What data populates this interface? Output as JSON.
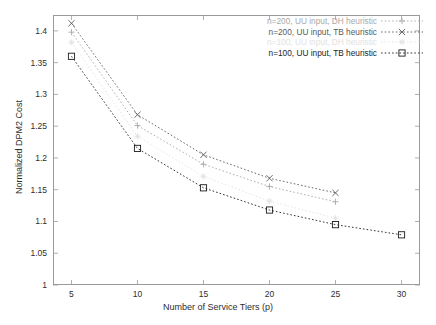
{
  "chart_data": {
    "type": "line",
    "title": "",
    "xlabel": "Number of Service Tiers (p)",
    "ylabel": "Normalized DPM2 Cost",
    "xlim": [
      3.6,
      31.4
    ],
    "ylim": [
      1,
      1.425
    ],
    "xticks": [
      5,
      10,
      15,
      20,
      25,
      30
    ],
    "xtick_labels": [
      "5",
      "10",
      "15",
      "20",
      "25",
      "30"
    ],
    "yticks": [
      1,
      1.05,
      1.1,
      1.15,
      1.2,
      1.25,
      1.3,
      1.35,
      1.4
    ],
    "ytick_labels": [
      "1",
      "1.05",
      "1.1",
      "1.15",
      "1.2",
      "1.25",
      "1.3",
      "1.35",
      "1.4"
    ],
    "grid": false,
    "legend_position": "top-right",
    "series": [
      {
        "name": "n=200, UU input, DH heuristic",
        "marker": "plus",
        "color": "#a9a9a9",
        "linestyle": "dotted",
        "x": [
          5,
          10,
          15,
          20,
          25
        ],
        "values": [
          1.398,
          1.251,
          1.19,
          1.155,
          1.131
        ]
      },
      {
        "name": "n=200, UU input, TB heuristic",
        "marker": "cross",
        "color": "#5a5a5a",
        "linestyle": "dotted",
        "x": [
          5,
          10,
          15,
          20,
          25
        ],
        "values": [
          1.412,
          1.268,
          1.205,
          1.168,
          1.145
        ]
      },
      {
        "name": "n=100, UU input, DH heuristic",
        "marker": "star",
        "color": "#e2e2e2",
        "linestyle": "dotted",
        "x": [
          5,
          10,
          15,
          20,
          25
        ],
        "values": [
          1.382,
          1.234,
          1.171,
          1.132,
          1.105
        ]
      },
      {
        "name": "n=100, UU input, TB heuristic",
        "marker": "square",
        "color": "#1c1c1c",
        "linestyle": "dotted",
        "x": [
          5,
          10,
          15,
          20,
          25,
          30
        ],
        "values": [
          1.36,
          1.215,
          1.153,
          1.118,
          1.095,
          1.079
        ]
      }
    ]
  }
}
